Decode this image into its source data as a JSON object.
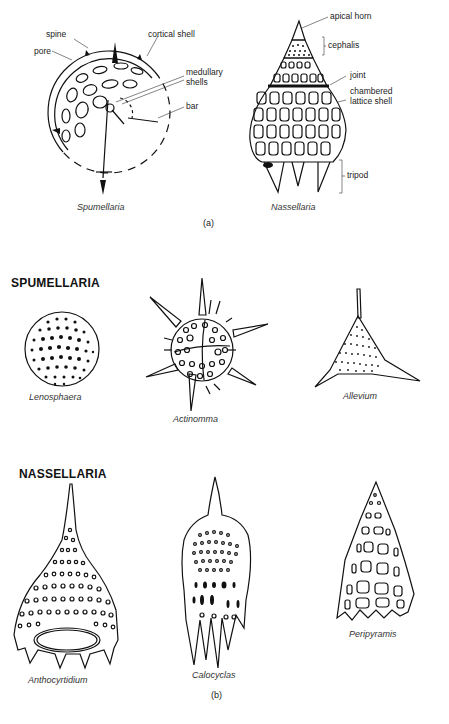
{
  "figure": {
    "panel_a": {
      "label": "(a)",
      "spumellaria": {
        "caption": "Spumellaria",
        "labels": {
          "spine": "spine",
          "pore": "pore",
          "cortical_shell": "cortical shell",
          "medullary_shells_line1": "medullary",
          "medullary_shells_line2": "shells",
          "bar": "bar"
        }
      },
      "nassellaria": {
        "caption": "Nassellaria",
        "labels": {
          "apical_horn": "apical horn",
          "cephalis": "cephalis",
          "joint": "joint",
          "chambered_lattice_shell_line1": "chambered",
          "chambered_lattice_shell_line2": "lattice shell",
          "tripod": "tripod"
        }
      }
    },
    "panel_b": {
      "label": "(b)",
      "spumellaria": {
        "heading": "SPUMELLARIA",
        "specimens": [
          {
            "caption": "Lenosphaera"
          },
          {
            "caption": "Actinomma"
          },
          {
            "caption": "Allevium"
          }
        ]
      },
      "nassellaria": {
        "heading": "NASSELLARIA",
        "specimens": [
          {
            "caption": "Anthocyrtidium"
          },
          {
            "caption": "Calocyclas"
          },
          {
            "caption": "Peripyramis"
          }
        ]
      }
    }
  }
}
